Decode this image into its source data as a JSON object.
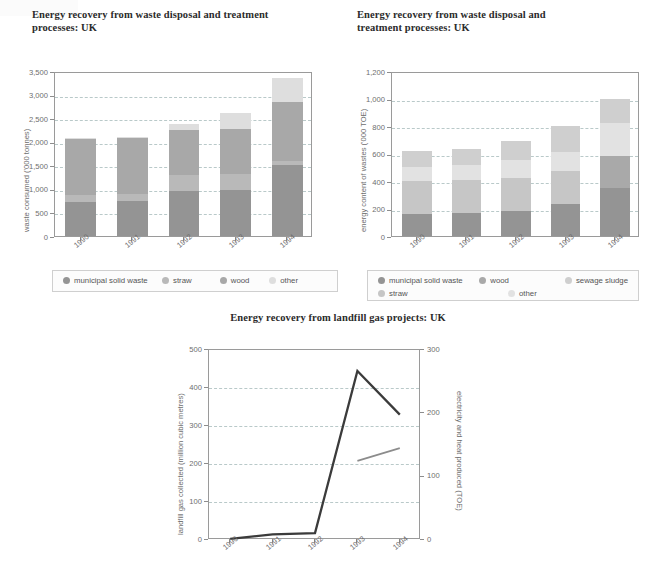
{
  "colors": {
    "municipal_solid_waste": "#949494",
    "straw": "#b9b9b9",
    "wood": "#a8a8a8",
    "other": "#dedede",
    "sewage_sludge": "#c9c9c9",
    "c2_municipal_solid_waste": "#949494",
    "c2_straw": "#c6c6c6",
    "c2_wood": "#a9a9a9",
    "c2_other": "#e2e2e2",
    "c2_sewage_sludge": "#cfcfcf",
    "grid": "#b9c9c9",
    "axis": "#9a9a9a",
    "line_landfill_gas": "#3b3b3b",
    "line_electricity_heat": "#8c8c8c"
  },
  "chart_data": [
    {
      "id": "waste-consumed",
      "type": "bar",
      "stacked": true,
      "title": "Energy recovery from waste disposal and treatment processes: UK",
      "xlabel": "",
      "ylabel": "waste consumed ('000 tonnes)",
      "categories": [
        "1990",
        "1991",
        "1992",
        "1993",
        "1994"
      ],
      "ylim": [
        0,
        3500
      ],
      "yticks": [
        0,
        500,
        1000,
        1500,
        2000,
        2500,
        3000,
        3500
      ],
      "ytick_labels": [
        "0",
        "500",
        "1,000",
        "1,500",
        "2,000",
        "2,500",
        "3,000",
        "3,500"
      ],
      "grid": true,
      "legend_position": "bottom",
      "series": [
        {
          "name": "municipal solid waste",
          "color_key": "municipal_solid_waste",
          "values": [
            720,
            745,
            955,
            980,
            1500
          ]
        },
        {
          "name": "straw",
          "color_key": "straw",
          "values": [
            160,
            150,
            340,
            330,
            100
          ]
        },
        {
          "name": "wood",
          "color_key": "wood",
          "values": [
            1180,
            1190,
            950,
            960,
            1250
          ]
        },
        {
          "name": "other",
          "color_key": "other",
          "values": [
            20,
            15,
            125,
            340,
            500
          ]
        }
      ]
    },
    {
      "id": "energy-content",
      "type": "bar",
      "stacked": true,
      "title": "Energy recovery from waste disposal and treatment processes: UK",
      "xlabel": "",
      "ylabel": "energy content of wastes ('000 TOE)",
      "categories": [
        "1990",
        "1991",
        "1992",
        "1993",
        "1994"
      ],
      "ylim": [
        0,
        1200
      ],
      "yticks": [
        0,
        200,
        400,
        600,
        800,
        1000,
        1200
      ],
      "ytick_labels": [
        "0",
        "200",
        "400",
        "600",
        "800",
        "1,000",
        "1,200"
      ],
      "grid": true,
      "legend_position": "bottom",
      "series": [
        {
          "name": "municipal solid waste",
          "color_key": "c2_municipal_solid_waste",
          "values": [
            160,
            165,
            185,
            230,
            350
          ]
        },
        {
          "name": "straw",
          "color_key": "c2_straw",
          "values": [
            240,
            240,
            235,
            240,
            0
          ]
        },
        {
          "name": "wood",
          "color_key": "c2_wood",
          "values": [
            0,
            0,
            0,
            0,
            230
          ]
        },
        {
          "name": "other",
          "color_key": "c2_other",
          "values": [
            105,
            115,
            130,
            140,
            240
          ]
        },
        {
          "name": "sewage sludge",
          "color_key": "c2_sewage_sludge",
          "values": [
            115,
            115,
            140,
            190,
            180
          ]
        }
      ]
    },
    {
      "id": "landfill-gas",
      "type": "line",
      "title": "Energy recovery from landfill gas projects: UK",
      "xlabel": "",
      "ylabel": "landfill gas collected (million cubic metres)",
      "ylabel_right": "electricity and heat produced (TOE)",
      "categories": [
        "1990",
        "1991",
        "1992",
        "1993",
        "1994"
      ],
      "ylim": [
        0,
        500
      ],
      "yticks": [
        0,
        100,
        200,
        300,
        400,
        500
      ],
      "ytick_labels": [
        "0",
        "100",
        "200",
        "300",
        "400",
        "500"
      ],
      "ylim_right": [
        0,
        300
      ],
      "yticks_right": [
        0,
        100,
        200,
        300
      ],
      "ytick_labels_right": [
        "0",
        "100",
        "200",
        "300"
      ],
      "grid": true,
      "series": [
        {
          "name": "landfill gas collected",
          "axis": "left",
          "color_key": "line_landfill_gas",
          "x": [
            "1990",
            "1991",
            "1992",
            "1993",
            "1994"
          ],
          "values": [
            3,
            15,
            18,
            445,
            330
          ]
        },
        {
          "name": "electricity and heat produced",
          "axis": "right",
          "color_key": "line_electricity_heat",
          "x": [
            "1993",
            "1994"
          ],
          "values": [
            125,
            145
          ]
        }
      ]
    }
  ]
}
